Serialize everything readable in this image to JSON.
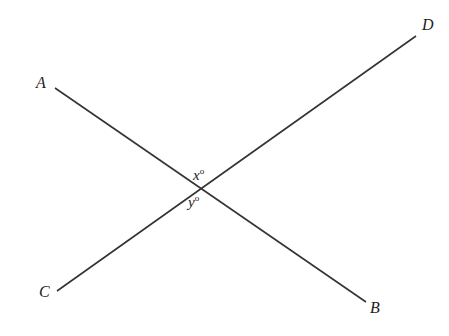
{
  "diagram": {
    "type": "intersecting-lines",
    "points": {
      "A": {
        "label": "A",
        "x": 55,
        "y": 88
      },
      "B": {
        "label": "B",
        "x": 366,
        "y": 302
      },
      "C": {
        "label": "C",
        "x": 57,
        "y": 291
      },
      "D": {
        "label": "D",
        "x": 416,
        "y": 36
      }
    },
    "lines": [
      {
        "from": "A",
        "to": "B"
      },
      {
        "from": "C",
        "to": "D"
      }
    ],
    "angles": {
      "x": {
        "label": "x",
        "unit": "o"
      },
      "y": {
        "label": "y",
        "unit": "o"
      }
    },
    "line_color": "#333333"
  }
}
